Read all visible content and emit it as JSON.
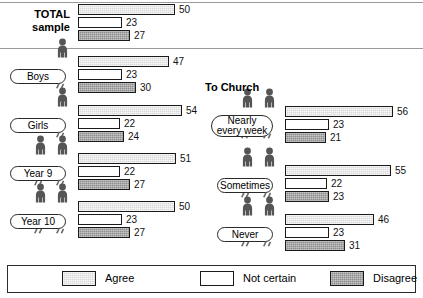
{
  "legend": {
    "items": [
      {
        "label": "Agree",
        "key": "agree",
        "color": "#d9d9d9",
        "icon": "swatch-agree"
      },
      {
        "label": "Not certain",
        "key": "notcertain",
        "color": "#ffffff",
        "icon": "swatch-not-certain"
      },
      {
        "label": "Disagree",
        "key": "disagree",
        "color": "#8d8d8d",
        "icon": "swatch-disagree"
      }
    ]
  },
  "sections": {
    "church_title": "To Church"
  },
  "chart_data": {
    "type": "bar",
    "title": "",
    "xlabel": "",
    "ylabel": "",
    "xlim": [
      0,
      60
    ],
    "grid": false,
    "legend_position": "bottom",
    "series": [
      {
        "name": "Agree",
        "key": "agree",
        "color": "#d9d9d9"
      },
      {
        "name": "Not certain",
        "key": "notcertain",
        "color": "#ffffff"
      },
      {
        "name": "Disagree",
        "key": "disagree",
        "color": "#8d8d8d"
      }
    ],
    "categories": [
      "TOTAL sample",
      "Boys",
      "Girls",
      "Year 9",
      "Year 10",
      "Nearly every week",
      "Sometimes",
      "Never"
    ],
    "groups": [
      {
        "label": "TOTAL\nsample",
        "label_style": "bold-text",
        "figures": 0,
        "panel": "left",
        "values": {
          "agree": 50,
          "notcertain": 23,
          "disagree": 27
        }
      },
      {
        "label": "Boys",
        "label_style": "pill",
        "figures": 1,
        "panel": "left",
        "values": {
          "agree": 47,
          "notcertain": 23,
          "disagree": 30
        }
      },
      {
        "label": "Girls",
        "label_style": "pill",
        "figures": 1,
        "panel": "left",
        "values": {
          "agree": 54,
          "notcertain": 22,
          "disagree": 24
        }
      },
      {
        "label": "Year 9",
        "label_style": "pill",
        "figures": 2,
        "panel": "left",
        "values": {
          "agree": 51,
          "notcertain": 22,
          "disagree": 27
        }
      },
      {
        "label": "Year 10",
        "label_style": "pill",
        "figures": 2,
        "panel": "left",
        "values": {
          "agree": 50,
          "notcertain": 23,
          "disagree": 27
        }
      },
      {
        "label": "Nearly\nevery week",
        "label_style": "pill",
        "figures": 2,
        "panel": "right",
        "values": {
          "agree": 56,
          "notcertain": 23,
          "disagree": 21
        }
      },
      {
        "label": "Sometimes",
        "label_style": "pill",
        "figures": 2,
        "panel": "right",
        "values": {
          "agree": 55,
          "notcertain": 22,
          "disagree": 23
        }
      },
      {
        "label": "Never",
        "label_style": "pill",
        "figures": 2,
        "panel": "right",
        "values": {
          "agree": 46,
          "notcertain": 23,
          "disagree": 31
        }
      }
    ],
    "value_labels": {
      "total_sample": [
        "50",
        "23",
        "27"
      ],
      "boys": [
        "47",
        "23",
        "30"
      ],
      "girls": [
        "54",
        "22",
        "24"
      ],
      "year_9": [
        "51",
        "22",
        "27"
      ],
      "year_10": [
        "50",
        "23",
        "27"
      ],
      "nearly_every_week": [
        "56",
        "23",
        "21"
      ],
      "sometimes": [
        "55",
        "22",
        "23"
      ],
      "never": [
        "46",
        "23",
        "31"
      ]
    }
  }
}
